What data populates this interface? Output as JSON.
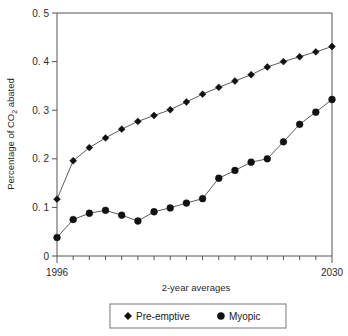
{
  "chart_data": {
    "type": "line",
    "title": "",
    "xlabel": "2-year averages",
    "ylabel": "Percentage of CO2 abated",
    "ylabel_prefix": "Percentage of CO",
    "ylabel_sub": "2",
    "ylabel_suffix": " abated",
    "xlim": [
      1996,
      2030
    ],
    "ylim": [
      0,
      0.5
    ],
    "grid": false,
    "x": [
      1996,
      1998,
      2000,
      2002,
      2004,
      2006,
      2008,
      2010,
      2012,
      2014,
      2016,
      2018,
      2020,
      2022,
      2024,
      2026,
      2028,
      2030
    ],
    "x_tick_labels": [
      "1996",
      "2030"
    ],
    "x_tick_count": 18,
    "y_ticks": [
      0,
      0.1,
      0.2,
      0.3,
      0.4,
      0.5
    ],
    "y_tick_labels": [
      "0",
      "0. 1",
      "0. 2",
      "0. 3",
      "0. 4",
      "0. 5"
    ],
    "series": [
      {
        "name": "Pre-emptive",
        "marker": "diamond",
        "color": "#111111",
        "values": [
          0.117,
          0.196,
          0.223,
          0.243,
          0.261,
          0.277,
          0.289,
          0.301,
          0.317,
          0.333,
          0.347,
          0.36,
          0.373,
          0.389,
          0.4,
          0.41,
          0.42,
          0.431
        ]
      },
      {
        "name": "Myopic",
        "marker": "circle",
        "color": "#111111",
        "values": [
          0.038,
          0.075,
          0.088,
          0.094,
          0.084,
          0.072,
          0.091,
          0.099,
          0.109,
          0.118,
          0.16,
          0.176,
          0.193,
          0.2,
          0.235,
          0.271,
          0.296,
          0.322
        ]
      }
    ],
    "legend": {
      "position": "bottom",
      "entries": [
        {
          "label": "Pre-emptive",
          "marker": "diamond"
        },
        {
          "label": "Myopic",
          "marker": "circle"
        }
      ]
    }
  }
}
